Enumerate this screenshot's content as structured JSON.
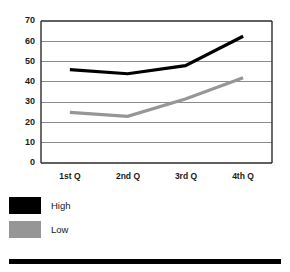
{
  "chart_data": {
    "type": "line",
    "title": "",
    "subtitle": "",
    "xlabel": "",
    "ylabel": "",
    "categories": [
      "1st Q",
      "2nd Q",
      "3rd Q",
      "4th Q"
    ],
    "series": [
      {
        "name": "High",
        "values": [
          46,
          44,
          48,
          62.5
        ],
        "color": "#000000"
      },
      {
        "name": "Low",
        "values": [
          25,
          23,
          31.5,
          42
        ],
        "color": "#969696"
      }
    ],
    "ylim": [
      0,
      70
    ],
    "yticks": [
      0,
      10,
      20,
      30,
      40,
      50,
      60,
      70
    ],
    "ytick_labels": [
      "0",
      "10",
      "20",
      "30",
      "40",
      "50",
      "60",
      "70"
    ],
    "grid": true,
    "grid_axis": "y",
    "legend_position": "below-left",
    "legend_entries": [
      {
        "label": "High",
        "color": "#000000"
      },
      {
        "label": "Low",
        "color": "#969696"
      }
    ],
    "annotations": []
  },
  "colors": {
    "high_series": "#000000",
    "low_series": "#969696",
    "axis": "#2b2b2b",
    "gridline": "#8c8c8c",
    "background": "#ffffff",
    "footer_rule": "#000000"
  },
  "axis": {
    "y_tick_0": "0",
    "y_tick_1": "10",
    "y_tick_2": "20",
    "y_tick_3": "30",
    "y_tick_4": "40",
    "y_tick_5": "50",
    "y_tick_6": "60",
    "y_tick_7": "70",
    "x_tick_0": "1st Q",
    "x_tick_1": "2nd Q",
    "x_tick_2": "3rd Q",
    "x_tick_3": "4th Q"
  },
  "legend": {
    "entry_0_label": "High",
    "entry_1_label": "Low"
  }
}
